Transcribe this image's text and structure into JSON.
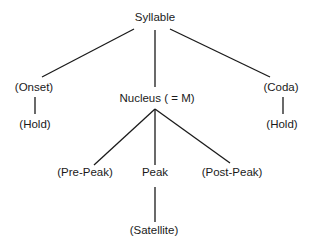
{
  "diagram": {
    "type": "tree",
    "nodes": {
      "syllable": {
        "label": "Syllable",
        "x": 155,
        "y": 18
      },
      "onset": {
        "label": "(Onset)",
        "x": 34,
        "y": 88
      },
      "onset_hold": {
        "label": "(Hold)",
        "x": 35,
        "y": 125
      },
      "nucleus": {
        "label": "Nucleus ( = M)",
        "x": 157,
        "y": 99
      },
      "coda": {
        "label": "(Coda)",
        "x": 281,
        "y": 88
      },
      "coda_hold": {
        "label": "(Hold)",
        "x": 282,
        "y": 125
      },
      "pre_peak": {
        "label": "(Pre-Peak)",
        "x": 85,
        "y": 173
      },
      "peak": {
        "label": "Peak",
        "x": 155,
        "y": 173
      },
      "post_peak": {
        "label": "(Post-Peak)",
        "x": 232,
        "y": 173
      },
      "satellite": {
        "label": "(Satellite)",
        "x": 154,
        "y": 231
      }
    },
    "edges": [
      {
        "from": "syllable",
        "to": "onset",
        "x1": 134,
        "y1": 29,
        "x2": 42,
        "y2": 77
      },
      {
        "from": "syllable",
        "to": "nucleus",
        "x1": 155,
        "y1": 30,
        "x2": 155,
        "y2": 87
      },
      {
        "from": "syllable",
        "to": "coda",
        "x1": 170,
        "y1": 29,
        "x2": 270,
        "y2": 77
      },
      {
        "from": "onset",
        "to": "onset_hold",
        "x1": 35,
        "y1": 97,
        "x2": 35,
        "y2": 114
      },
      {
        "from": "coda",
        "to": "coda_hold",
        "x1": 283,
        "y1": 97,
        "x2": 283,
        "y2": 114
      },
      {
        "from": "nucleus",
        "to": "pre_peak",
        "x1": 155,
        "y1": 109,
        "x2": 94,
        "y2": 165
      },
      {
        "from": "nucleus",
        "to": "peak",
        "x1": 155,
        "y1": 109,
        "x2": 155,
        "y2": 165
      },
      {
        "from": "nucleus",
        "to": "post_peak",
        "x1": 155,
        "y1": 109,
        "x2": 230,
        "y2": 163
      },
      {
        "from": "peak",
        "to": "satellite",
        "x1": 155,
        "y1": 187,
        "x2": 155,
        "y2": 222
      }
    ],
    "colors": {
      "line": "#1a1a1a",
      "text": "#1a1a1a",
      "background": "#ffffff"
    }
  }
}
